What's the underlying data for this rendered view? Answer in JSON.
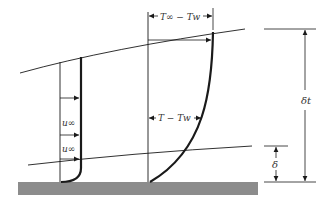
{
  "diagram": {
    "labels": {
      "u_inf_upper": "u∞",
      "u_inf_lower": "u∞",
      "temp_diff_free": "T∞ − Tw",
      "temp_diff_local": "T − Tw",
      "thermal_thickness": "δt",
      "velocity_thickness": "δ"
    },
    "colors": {
      "line": "#1a1a1a",
      "plate": "#8c8c8c",
      "background": "#ffffff"
    }
  }
}
